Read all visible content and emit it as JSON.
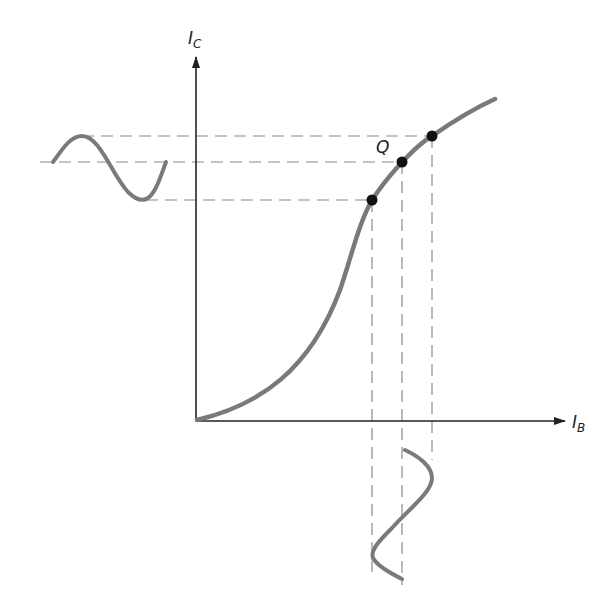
{
  "diagram": {
    "type": "transfer characteristic",
    "y_axis": {
      "label": "I",
      "subscript": "C"
    },
    "x_axis": {
      "label": "I",
      "subscript": "B"
    },
    "q_point_label": "Q",
    "points": [
      {
        "name": "lower",
        "x": 372,
        "y": 200
      },
      {
        "name": "Q",
        "x": 402,
        "y": 162
      },
      {
        "name": "upper",
        "x": 432,
        "y": 136
      }
    ],
    "colors": {
      "curve": "#7a7a7a",
      "axis": "#222222",
      "dash": "#8a8a8a",
      "point": "#111111"
    }
  }
}
